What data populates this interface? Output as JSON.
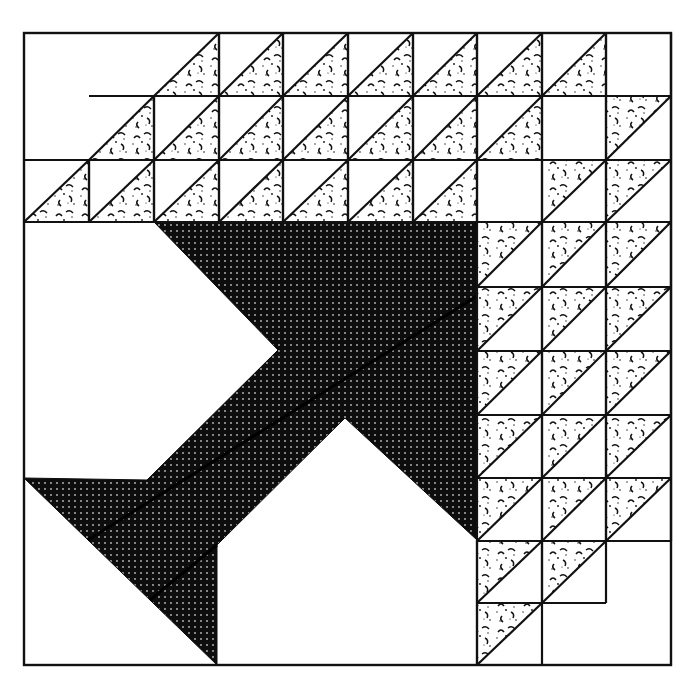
{
  "figure": {
    "colors": {
      "background": "#ffffff",
      "line": "#111111",
      "dark_fabric": "#0d0d0d",
      "dark_dot": "#bdbdbd",
      "print_fabric": "#111111"
    },
    "block": {
      "x0": 24,
      "y0": 33,
      "x1": 671,
      "y1": 665
    },
    "top_grid": {
      "cols": [
        24,
        89,
        154,
        219,
        283,
        348,
        413,
        477,
        542,
        606,
        671
      ],
      "rows": [
        33,
        96,
        160,
        222
      ]
    },
    "right_grid": {
      "cols": [
        477,
        542,
        606,
        671
      ],
      "rows": [
        222,
        287,
        351,
        415,
        478,
        541,
        603,
        665
      ]
    },
    "arrow_polygon": "154,222 477,222 477,540 345,418 217,545 217,665 88,540 24,478 147,480 278,350"
  }
}
